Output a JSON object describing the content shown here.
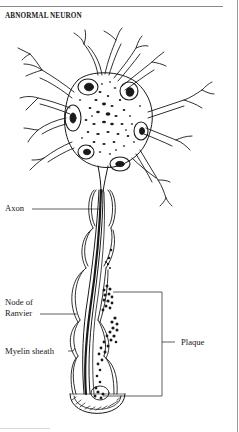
{
  "figure": {
    "title": "ABNORMAL NEURON",
    "labels": {
      "axon": "Axon",
      "node_line1": "Node of",
      "node_line2": "Ranvier",
      "myelin": "Myelin sheath",
      "plaque": "Plaque"
    },
    "colors": {
      "ink": "#1a1a1a",
      "background": "#ffffff",
      "frame": "#8a8a8a"
    }
  }
}
